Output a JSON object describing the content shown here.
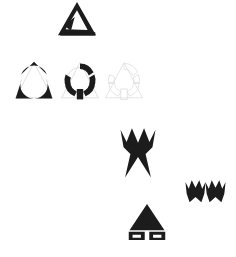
{
  "canvas": {
    "width": 236,
    "height": 257,
    "background": "#ffffff",
    "title": "Abstract geometric glyph composition"
  },
  "palette": {
    "ink": "#1c1c1c",
    "ink_soft": "#252525",
    "ghost": "#d8d8d8",
    "ghost_stroke": "#cfcfcf",
    "paper": "#ffffff"
  },
  "shapes": [
    {
      "id": "triangle-ring-top",
      "name": "triangle-with-circular-hole",
      "label": "Triangle Ring",
      "fill": "#1c1c1c",
      "x": 58,
      "y": 2,
      "width": 38,
      "height": 34,
      "rotation": 0
    },
    {
      "id": "claw-ring-left",
      "name": "segmented-triangle-ring-solid",
      "label": "Segmented Ring A",
      "fill": "#1c1c1c",
      "ghost": "#d8d8d8",
      "x": 14,
      "y": 61,
      "width": 40,
      "height": 42,
      "rotation": 0
    },
    {
      "id": "claw-ring-middle",
      "name": "segmented-triangle-ring-annulus",
      "label": "Segmented Ring B",
      "fill": "#1c1c1c",
      "ghost": "#d8d8d8",
      "x": 60,
      "y": 61,
      "width": 40,
      "height": 42,
      "rotation": 0
    },
    {
      "id": "claw-ring-right",
      "name": "segmented-triangle-ring-outline",
      "label": "Segmented Ring C",
      "fill": "#d8d8d8",
      "ghost": "#dedede",
      "x": 104,
      "y": 61,
      "width": 40,
      "height": 42,
      "rotation": 0
    },
    {
      "id": "crown-large",
      "name": "three-point-crown-large",
      "label": "Crown Large",
      "fill": "#1c1c1c",
      "x": 119,
      "y": 126,
      "width": 38,
      "height": 53,
      "rotation": 0
    },
    {
      "id": "crown-small-a",
      "name": "three-point-crown-small",
      "label": "Crown Small A",
      "fill": "#1c1c1c",
      "x": 185,
      "y": 179,
      "width": 21,
      "height": 24,
      "rotation": 0
    },
    {
      "id": "crown-small-b",
      "name": "three-point-crown-small",
      "label": "Crown Small B",
      "fill": "#1c1c1c",
      "x": 205,
      "y": 179,
      "width": 21,
      "height": 24,
      "rotation": 0
    },
    {
      "id": "triangle-feet",
      "name": "triangle-with-feet",
      "label": "Footed Triangle",
      "fill": "#1c1c1c",
      "x": 128,
      "y": 204,
      "width": 38,
      "height": 36,
      "rotation": 0
    }
  ]
}
